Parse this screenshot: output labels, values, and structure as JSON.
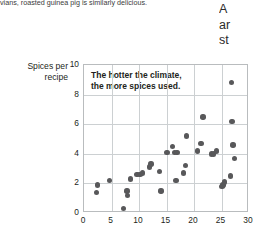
{
  "body_text": {
    "left_fragment": "vians, roasted guinea pig is similarly delicious.",
    "right_column_lines": [
      "A",
      "ar",
      "st"
    ]
  },
  "colors": {
    "dot": "#58585a",
    "gridline": "#ccd0d2",
    "axis_border": "#b9bcbe",
    "text": "#231f20"
  },
  "chart_data": {
    "type": "scatter",
    "title": "",
    "annotation": "The hotter the climate,\nthe more spices used.",
    "annotation_line1": "The hotter the climate,",
    "annotation_line2": "the more spices used.",
    "xlabel": "",
    "ylabel": "Spices per recipe",
    "ylabel_line1": "Spices per",
    "ylabel_line2": "recipe",
    "xlim": [
      0,
      30
    ],
    "ylim": [
      0,
      10
    ],
    "xticks": [
      0,
      5,
      10,
      15,
      20,
      25,
      30
    ],
    "yticks": [
      0,
      2,
      4,
      6,
      8,
      10
    ],
    "grid": true,
    "legend": "none",
    "points": [
      {
        "x": 2.4,
        "y": 1.9
      },
      {
        "x": 2.3,
        "y": 1.4
      },
      {
        "x": 4.6,
        "y": 2.2
      },
      {
        "x": 7.2,
        "y": 0.3
      },
      {
        "x": 7.8,
        "y": 1.5
      },
      {
        "x": 7.9,
        "y": 1.2
      },
      {
        "x": 8.4,
        "y": 2.3
      },
      {
        "x": 9.6,
        "y": 2.6
      },
      {
        "x": 10.2,
        "y": 2.6
      },
      {
        "x": 10.6,
        "y": 2.7
      },
      {
        "x": 11.9,
        "y": 3.1
      },
      {
        "x": 12.2,
        "y": 3.3
      },
      {
        "x": 13.7,
        "y": 2.8
      },
      {
        "x": 14.0,
        "y": 1.5
      },
      {
        "x": 15.1,
        "y": 4.1
      },
      {
        "x": 16.1,
        "y": 4.5
      },
      {
        "x": 16.4,
        "y": 4.1
      },
      {
        "x": 16.9,
        "y": 4.1
      },
      {
        "x": 16.7,
        "y": 2.2
      },
      {
        "x": 18.1,
        "y": 2.7
      },
      {
        "x": 18.4,
        "y": 3.2
      },
      {
        "x": 18.6,
        "y": 5.2
      },
      {
        "x": 20.6,
        "y": 4.2
      },
      {
        "x": 21.3,
        "y": 4.7
      },
      {
        "x": 21.6,
        "y": 6.5
      },
      {
        "x": 23.2,
        "y": 4.0
      },
      {
        "x": 23.5,
        "y": 4.0
      },
      {
        "x": 24.1,
        "y": 4.2
      },
      {
        "x": 25.1,
        "y": 1.8
      },
      {
        "x": 25.3,
        "y": 1.9
      },
      {
        "x": 25.5,
        "y": 2.1
      },
      {
        "x": 26.6,
        "y": 2.5
      },
      {
        "x": 26.8,
        "y": 8.8
      },
      {
        "x": 26.9,
        "y": 6.2
      },
      {
        "x": 27.1,
        "y": 4.6
      },
      {
        "x": 27.4,
        "y": 3.7
      }
    ]
  }
}
